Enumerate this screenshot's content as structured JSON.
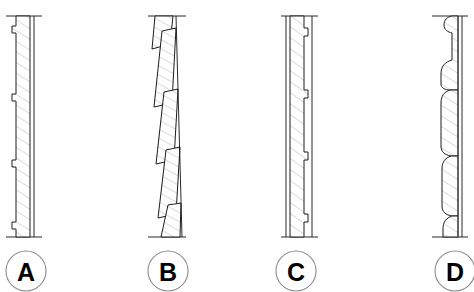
{
  "sheet": {
    "title": "Wall Cladding Section Details",
    "background_color": "#ffffff",
    "line_color": "#1c1c1c",
    "hatch_color": "#7d7d7d",
    "tag_circle_color": "#8c8c8c",
    "width": 474,
    "height": 292
  },
  "details": [
    {
      "tag": "A",
      "name": "detail-a",
      "description": "flush vertical board section with stepped rebated joints on outer face",
      "tag_center_x": 26,
      "tag_center_y": 271,
      "tag_radius": 20,
      "top_break_y": 16,
      "bottom_break_y": 237
    },
    {
      "tag": "B",
      "name": "detail-b",
      "description": "raked angled weatherboard section with lapped sloping boards",
      "tag_center_x": 168,
      "tag_center_y": 271,
      "tag_radius": 20,
      "top_break_y": 16,
      "bottom_break_y": 237
    },
    {
      "tag": "C",
      "name": "detail-c",
      "description": "flush vertical board section with stepped rebated joints on inner face",
      "tag_center_x": 296,
      "tag_center_y": 271,
      "tag_radius": 20,
      "top_break_y": 16,
      "bottom_break_y": 237
    },
    {
      "tag": "D",
      "name": "detail-d",
      "description": "curved profile shiplap board section with rounded ogee joints",
      "tag_center_x": 455,
      "tag_center_y": 271,
      "tag_radius": 20,
      "top_break_y": 16,
      "bottom_break_y": 237
    }
  ]
}
